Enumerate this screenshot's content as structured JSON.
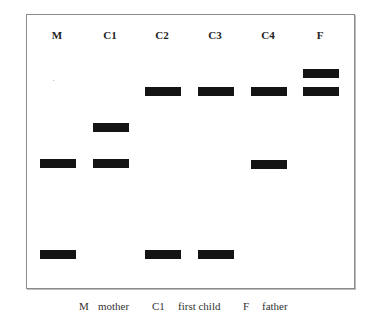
{
  "figure": {
    "title": "",
    "lanes": [
      {
        "id": "M",
        "label": "M"
      },
      {
        "id": "C1",
        "label": "C1"
      },
      {
        "id": "C2",
        "label": "C2"
      },
      {
        "id": "C3",
        "label": "C3"
      },
      {
        "id": "C4",
        "label": "C4"
      },
      {
        "id": "F",
        "label": "F"
      }
    ],
    "bands": {
      "M": [
        "band-5",
        "band-6"
      ],
      "C1": [
        "band-3",
        "band-5"
      ],
      "C2": [
        "band-2",
        "band-6"
      ],
      "C3": [
        "band-2",
        "band-6"
      ],
      "C4": [
        "band-2",
        "band-5"
      ],
      "F": [
        "band-1",
        "band-2"
      ]
    },
    "band_color": "#141414",
    "border_color": "#8a8a8a"
  },
  "legend": {
    "items": [
      {
        "key": "M",
        "value": "mother"
      },
      {
        "key": "C1",
        "value": "first child"
      },
      {
        "key": "F",
        "value": "father"
      }
    ]
  }
}
